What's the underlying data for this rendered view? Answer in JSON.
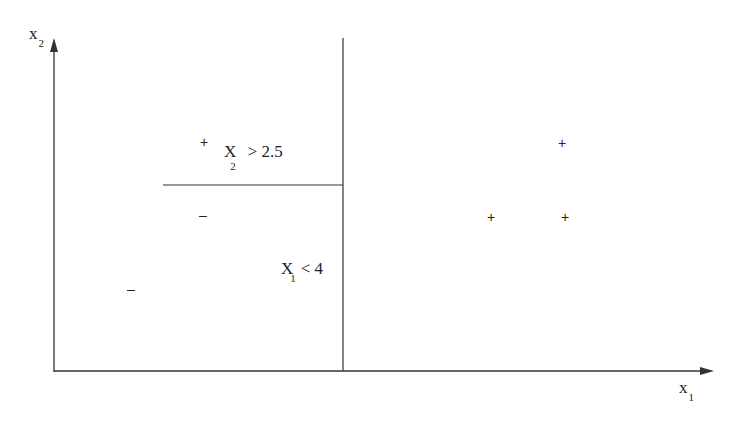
{
  "axes": {
    "y_label": "x",
    "y_label_sub": "2",
    "x_label": "x",
    "x_label_sub": "1"
  },
  "splits": [
    {
      "var": "X",
      "sub": "1",
      "op": "< 4"
    },
    {
      "var": "X",
      "sub": "2",
      "op": "> 2.5"
    }
  ],
  "points": [
    {
      "sign": "+",
      "x": 205,
      "y": 143
    },
    {
      "sign": "–",
      "x": 205,
      "y": 216
    },
    {
      "sign": "–",
      "x": 133,
      "y": 290
    },
    {
      "sign": "+",
      "x": 563,
      "y": 144
    },
    {
      "sign": "+",
      "x": 492,
      "y": 218
    },
    {
      "sign": "+",
      "x": 566,
      "y": 218
    }
  ],
  "colors": {
    "ink": "#222222",
    "background": "#ffffff"
  }
}
